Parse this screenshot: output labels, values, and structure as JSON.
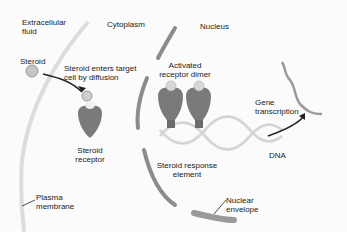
{
  "diagram": {
    "regions": {
      "extracellular_line1": "Extracellular",
      "extracellular_line2": "fluid",
      "cytoplasm": "Cytoplasm",
      "nucleus": "Nucleus"
    },
    "labels": {
      "steroid": "Steroid",
      "enters_line1": "Steroid enters target",
      "enters_line2": "cell by diffusion",
      "receptor_line1": "Steroid",
      "receptor_line2": "receptor",
      "dimer_line1": "Activated",
      "dimer_line2": "receptor dimer",
      "gene_line1": "Gene",
      "gene_line2": "transcription",
      "response_line1": "Steroid response",
      "response_line2": "element",
      "dna": "DNA",
      "plasma_line1": "Plasma",
      "plasma_line2": "membrane",
      "envelope_line1": "Nuclear",
      "envelope_line2": "envelope"
    },
    "colors": {
      "receptor": "#7a7a7a",
      "steroid": "#c8c8c8",
      "membrane": "#d8d8d8",
      "nuclear_envelope": "#8c8c8c",
      "dna": "#e2e2e2",
      "mrna": "#9a9a9a"
    }
  }
}
